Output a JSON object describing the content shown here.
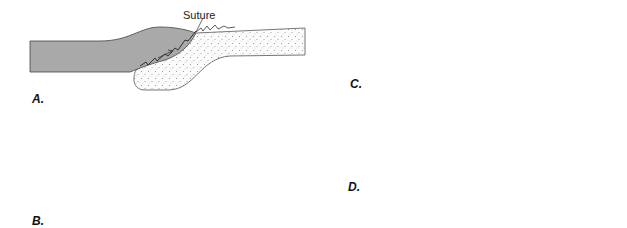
{
  "panels": [
    {
      "id": "A",
      "label": "A.",
      "annotation": "Suture"
    },
    {
      "id": "B",
      "label": "B."
    },
    {
      "id": "C",
      "label": "C."
    },
    {
      "id": "D",
      "label": "D."
    }
  ],
  "colors": {
    "plate_gray": "#a9a9a9",
    "stipple_fill": "#fbfbfb",
    "stipple_dot": "#8a8a8a",
    "line": "#444444",
    "fault": "#111111"
  }
}
